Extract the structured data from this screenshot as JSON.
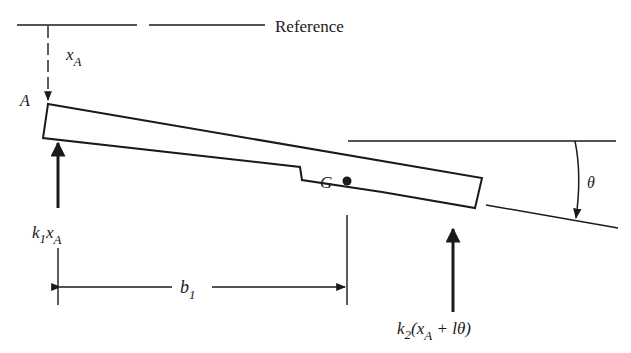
{
  "diagram": {
    "reference_label": "Reference",
    "point_A_label": "A",
    "center_label": "G",
    "xA": {
      "main": "x",
      "sub": "A"
    },
    "force_left": {
      "k": "k",
      "k_sub": "1",
      "x": "x",
      "x_sub": "A"
    },
    "force_right": {
      "k": "k",
      "k_sub": "2",
      "open": "(x",
      "x_sub": "A",
      "rest": " + lθ)"
    },
    "dimension_b1": {
      "main": "b",
      "sub": "1"
    },
    "angle_label": "θ",
    "colors": {
      "ink": "#1a1a1a",
      "background": "#ffffff"
    }
  }
}
